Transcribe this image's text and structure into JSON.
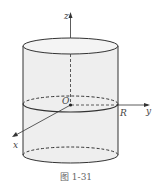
{
  "figure": {
    "caption": "图  1-31",
    "labels": {
      "z_axis": "z",
      "x_axis": "x",
      "y_axis": "y",
      "origin": "O",
      "radius": "R"
    },
    "colors": {
      "fill": "#eeeeee",
      "stroke": "#333333"
    }
  }
}
